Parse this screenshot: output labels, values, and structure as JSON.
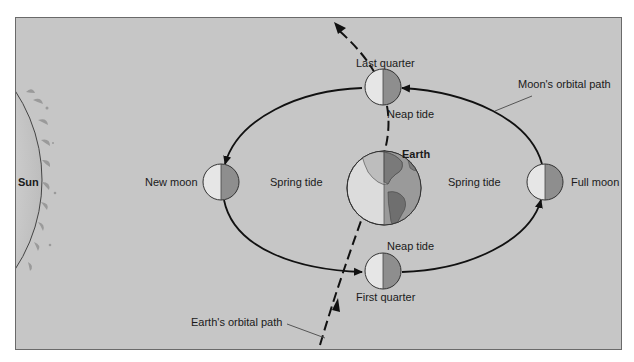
{
  "diagram": {
    "labels": {
      "sun": "Sun",
      "earth": "Earth",
      "new_moon": "New moon",
      "full_moon": "Full moon",
      "last_quarter": "Last quarter",
      "first_quarter": "First quarter",
      "neap_tide_top": "Neap tide",
      "neap_tide_bottom": "Neap tide",
      "spring_tide_left": "Spring tide",
      "spring_tide_right": "Spring tide",
      "moons_orbital_path": "Moon's orbital path",
      "earths_orbital_path": "Earth's orbital path"
    },
    "colors": {
      "background": "#c6c6c6",
      "frame_border": "#6a6a6a",
      "moon_lit": "#e6e6e6",
      "moon_dark": "#8e8e8e",
      "earth_ocean_lit": "#dcdcdc",
      "earth_ocean_dark": "#9a9a9a",
      "line": "#111111"
    }
  }
}
